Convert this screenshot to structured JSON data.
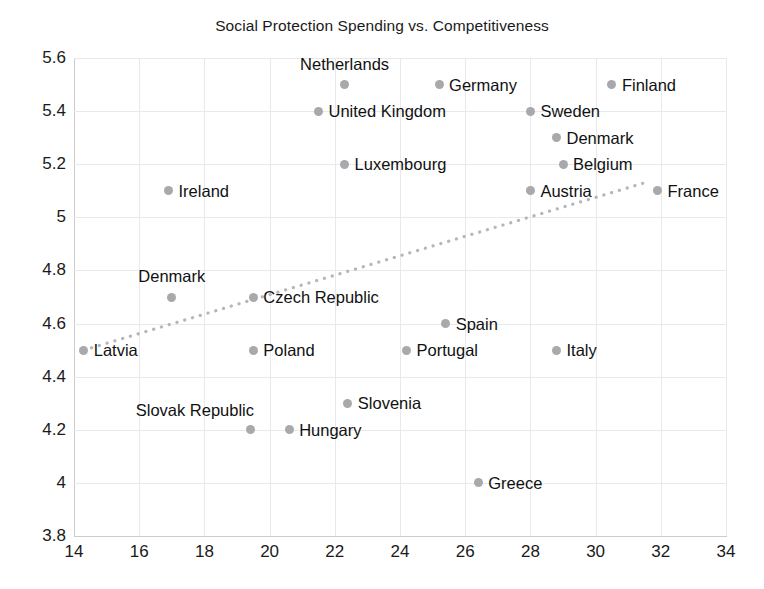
{
  "chart_data": {
    "type": "scatter",
    "title": "Social Protection Spending vs. Competitiveness",
    "xlabel": "",
    "ylabel": "",
    "xlim": [
      14,
      34
    ],
    "ylim": [
      3.8,
      5.6
    ],
    "xticks": [
      "14",
      "16",
      "18",
      "20",
      "22",
      "24",
      "26",
      "28",
      "30",
      "32",
      "34"
    ],
    "yticks": [
      "5.6",
      "5.4",
      "5.2",
      "5",
      "4.8",
      "4.6",
      "4.4",
      "4.2",
      "4",
      "3.8"
    ],
    "grid": true,
    "legend": "none",
    "marker_color": "#a9a9ad",
    "trendline": {
      "style": "dotted",
      "color": "#b5b5ba",
      "x_start": 14.3,
      "y_start": 4.5,
      "x_end": 31.5,
      "y_end": 5.13
    },
    "points": [
      {
        "label": "Netherlands",
        "x": 22.3,
        "y": 5.5,
        "label_pos": "above"
      },
      {
        "label": "Germany",
        "x": 25.2,
        "y": 5.5,
        "label_pos": "right"
      },
      {
        "label": "Finland",
        "x": 30.5,
        "y": 5.5,
        "label_pos": "right"
      },
      {
        "label": "United Kingdom",
        "x": 21.5,
        "y": 5.4,
        "label_pos": "right"
      },
      {
        "label": "Sweden",
        "x": 28.0,
        "y": 5.4,
        "label_pos": "right"
      },
      {
        "label": "Denmark",
        "x": 28.8,
        "y": 5.3,
        "label_pos": "right"
      },
      {
        "label": "Luxembourg",
        "x": 22.3,
        "y": 5.2,
        "label_pos": "right"
      },
      {
        "label": "Belgium",
        "x": 29.0,
        "y": 5.2,
        "label_pos": "right"
      },
      {
        "label": "Ireland",
        "x": 16.9,
        "y": 5.1,
        "label_pos": "right"
      },
      {
        "label": "Austria",
        "x": 28.0,
        "y": 5.1,
        "label_pos": "right"
      },
      {
        "label": "France",
        "x": 31.9,
        "y": 5.1,
        "label_pos": "right"
      },
      {
        "label": "Denmark",
        "x": 17.0,
        "y": 4.7,
        "label_pos": "above"
      },
      {
        "label": "Czech Republic",
        "x": 19.5,
        "y": 4.7,
        "label_pos": "right"
      },
      {
        "label": "Spain",
        "x": 25.4,
        "y": 4.6,
        "label_pos": "right"
      },
      {
        "label": "Latvia",
        "x": 14.3,
        "y": 4.5,
        "label_pos": "right"
      },
      {
        "label": "Poland",
        "x": 19.5,
        "y": 4.5,
        "label_pos": "right"
      },
      {
        "label": "Portugal",
        "x": 24.2,
        "y": 4.5,
        "label_pos": "right"
      },
      {
        "label": "Italy",
        "x": 28.8,
        "y": 4.5,
        "label_pos": "right"
      },
      {
        "label": "Slovenia",
        "x": 22.4,
        "y": 4.3,
        "label_pos": "right"
      },
      {
        "label": "Slovak Republic",
        "x": 19.4,
        "y": 4.2,
        "label_pos": "above-left"
      },
      {
        "label": "Hungary",
        "x": 20.6,
        "y": 4.2,
        "label_pos": "right"
      },
      {
        "label": "Greece",
        "x": 26.4,
        "y": 4.0,
        "label_pos": "right"
      }
    ]
  }
}
